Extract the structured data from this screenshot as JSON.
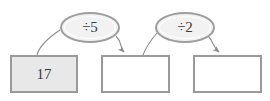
{
  "diagram": {
    "type": "function-machine-flow",
    "background_color": "#ffffff",
    "stroke_color": "#8c8c8c",
    "box_border_color": "#9a9a9a",
    "box_fill_given": "#e8e8e8",
    "box_fill_blank": "#ffffff",
    "ellipse_fill": "#f2f2f2",
    "text_color": "#3b3b3b",
    "boxes": [
      {
        "id": "box-1",
        "label": "17",
        "state": "filled"
      },
      {
        "id": "box-2",
        "label": "",
        "state": "empty"
      },
      {
        "id": "box-3",
        "label": "",
        "state": "empty"
      }
    ],
    "operations": [
      {
        "id": "op-1",
        "label": "÷5"
      },
      {
        "id": "op-2",
        "label": "÷2"
      }
    ]
  }
}
